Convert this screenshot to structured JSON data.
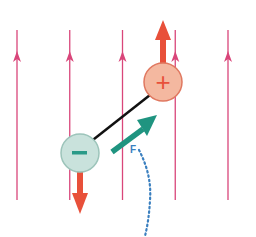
{
  "diagram": {
    "field_lines": {
      "count": 5,
      "direction": "up",
      "color": "#d9467a"
    },
    "charges": [
      {
        "sign": "positive",
        "symbol": "+",
        "fill": "#f4b8a0",
        "stroke": "#e07860",
        "symbol_color": "#e8503a"
      },
      {
        "sign": "negative",
        "symbol": "−",
        "fill": "#c9e2dc",
        "stroke": "#9cc4ba",
        "symbol_color": "#2a9a88"
      }
    ],
    "forces": {
      "on_positive": {
        "direction": "up",
        "color": "#e8503a"
      },
      "on_negative": {
        "direction": "down",
        "color": "#e8503a"
      }
    },
    "dipole_arrow": {
      "color": "#1f9480"
    },
    "rotation_path": {
      "label": "F",
      "color": "#3a7fbf",
      "style": "dotted"
    },
    "rod_color": "#111111"
  }
}
